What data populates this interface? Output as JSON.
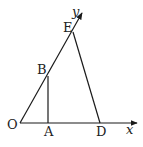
{
  "diagram": {
    "type": "geometry",
    "axes": {
      "x_label": "x",
      "y_label": "y"
    },
    "points": {
      "O": {
        "label": "O"
      },
      "A": {
        "label": "A"
      },
      "B": {
        "label": "B"
      },
      "D": {
        "label": "D"
      },
      "E": {
        "label": "E"
      }
    },
    "segments": [
      "OE (along y-axis)",
      "AB (vertical)",
      "ED",
      "OD (along x-axis)"
    ],
    "colors": {
      "line": "#1a1a1a",
      "text": "#222222",
      "background": "#ffffff"
    }
  }
}
